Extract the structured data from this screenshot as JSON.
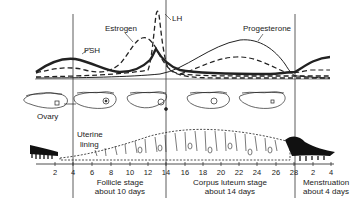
{
  "hormones": {
    "fsh": "FSH",
    "estrogen": "Estrogen",
    "lh": "LH",
    "progesterone": "Progesterone"
  },
  "labels": {
    "ovary": "Ovary",
    "uterine_lining_1": "Uterine",
    "uterine_lining_2": "lining"
  },
  "stages": {
    "follicle_1": "Follicle stage",
    "follicle_2": "about 10 days",
    "corpus_1": "Corpus luteum stage",
    "corpus_2": "about 14 days",
    "menstruation_1": "Menstruation",
    "menstruation_2": "about 4 days"
  },
  "axis": {
    "ticks": [
      "2",
      "4",
      "6",
      "8",
      "10",
      "12",
      "14",
      "16",
      "18",
      "20",
      "22",
      "24",
      "26",
      "28",
      "2",
      "4"
    ]
  },
  "colors": {
    "ink": "#222222",
    "background": "#ffffff"
  }
}
